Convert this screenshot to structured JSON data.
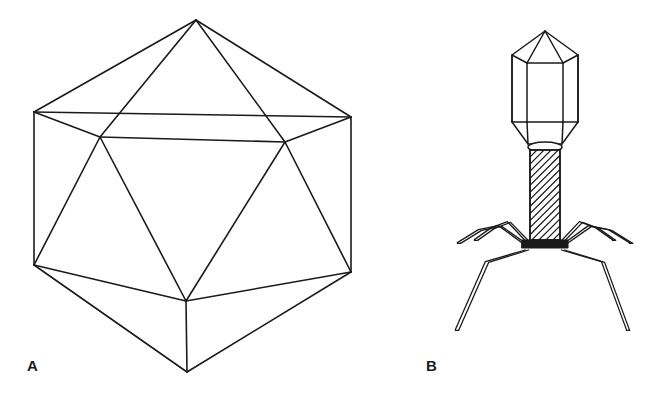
{
  "figure": {
    "background_color": "#ffffff",
    "stroke_color": "#1a1a1a",
    "width": 647,
    "height": 401
  },
  "panels": [
    {
      "id": "panel-a",
      "label": "A",
      "label_x": 27,
      "label_y": 358,
      "subject": "icosahedral virus capsid",
      "description": "Wireframe icosahedron seen from a vertex-on-edge orientation"
    },
    {
      "id": "panel-b",
      "label": "B",
      "label_x": 426,
      "label_y": 358,
      "subject": "bacteriophage",
      "description": "Tailed bacteriophage with prolate hexagonal head, collar, striated contractile sheath, base plate and six tail fibers"
    }
  ],
  "icosahedron": {
    "stroke_width": 1.6,
    "vertices": {
      "top_apex": [
        196,
        20
      ],
      "upper_left": [
        34,
        112
      ],
      "upper_right": [
        351,
        117
      ],
      "mid_left": [
        100,
        137
      ],
      "mid_right": [
        285,
        142
      ],
      "lower_left": [
        34,
        265
      ],
      "lower_right": [
        351,
        272
      ],
      "mid_bottom": [
        186,
        301
      ],
      "bottom_apex": [
        187,
        372
      ]
    },
    "edges": [
      [
        "top_apex",
        "upper_left"
      ],
      [
        "top_apex",
        "upper_right"
      ],
      [
        "top_apex",
        "mid_left"
      ],
      [
        "top_apex",
        "mid_right"
      ],
      [
        "upper_left",
        "upper_right"
      ],
      [
        "upper_left",
        "mid_left"
      ],
      [
        "upper_right",
        "mid_right"
      ],
      [
        "upper_left",
        "lower_left"
      ],
      [
        "upper_right",
        "lower_right"
      ],
      [
        "mid_left",
        "mid_right"
      ],
      [
        "mid_left",
        "lower_left"
      ],
      [
        "mid_right",
        "lower_right"
      ],
      [
        "mid_left",
        "mid_bottom"
      ],
      [
        "mid_right",
        "mid_bottom"
      ],
      [
        "lower_left",
        "mid_bottom"
      ],
      [
        "lower_right",
        "mid_bottom"
      ],
      [
        "lower_left",
        "bottom_apex"
      ],
      [
        "lower_right",
        "bottom_apex"
      ],
      [
        "mid_bottom",
        "bottom_apex"
      ]
    ]
  },
  "bacteriophage": {
    "stroke_width": 1.5,
    "head": {
      "name": "capsid-head",
      "apex": [
        545,
        31
      ],
      "upper_left": [
        512,
        55
      ],
      "upper_mid_left": [
        527,
        63
      ],
      "upper_mid_right": [
        563,
        63
      ],
      "upper_right": [
        578,
        55
      ],
      "lower_left": [
        512,
        122
      ],
      "lower_mid_left": [
        527,
        122
      ],
      "lower_mid_right": [
        563,
        122
      ],
      "lower_right": [
        578,
        122
      ],
      "bottom_left": [
        528,
        144
      ],
      "bottom_right": [
        562,
        144
      ]
    },
    "collar": {
      "name": "collar-neck",
      "center": [
        545,
        147
      ],
      "rx": 17,
      "ry": 5
    },
    "sheath": {
      "name": "striated-tail-sheath",
      "left": 530,
      "right": 560,
      "top": 150,
      "bottom": 240,
      "stripe_count": 17
    },
    "base_plate": {
      "name": "base-plate",
      "left": 522,
      "right": 568,
      "top": 240,
      "bottom": 248
    },
    "tail_fibers": [
      {
        "name": "fiber-upper-left",
        "points": [
          [
            528,
            246
          ],
          [
            500,
            226
          ],
          [
            480,
            230
          ],
          [
            459,
            243
          ]
        ]
      },
      {
        "name": "fiber-upper-right",
        "points": [
          [
            562,
            246
          ],
          [
            590,
            226
          ],
          [
            610,
            230
          ],
          [
            631,
            243
          ]
        ]
      },
      {
        "name": "fiber-mid-left",
        "points": [
          [
            530,
            244
          ],
          [
            509,
            222
          ],
          [
            493,
            228
          ],
          [
            476,
            240
          ]
        ]
      },
      {
        "name": "fiber-mid-right",
        "points": [
          [
            560,
            244
          ],
          [
            581,
            222
          ],
          [
            597,
            228
          ],
          [
            614,
            240
          ]
        ]
      },
      {
        "name": "fiber-lower-left",
        "points": [
          [
            527,
            250
          ],
          [
            487,
            262
          ],
          [
            457,
            330
          ]
        ]
      },
      {
        "name": "fiber-lower-right",
        "points": [
          [
            563,
            250
          ],
          [
            603,
            262
          ],
          [
            628,
            330
          ]
        ]
      }
    ]
  }
}
